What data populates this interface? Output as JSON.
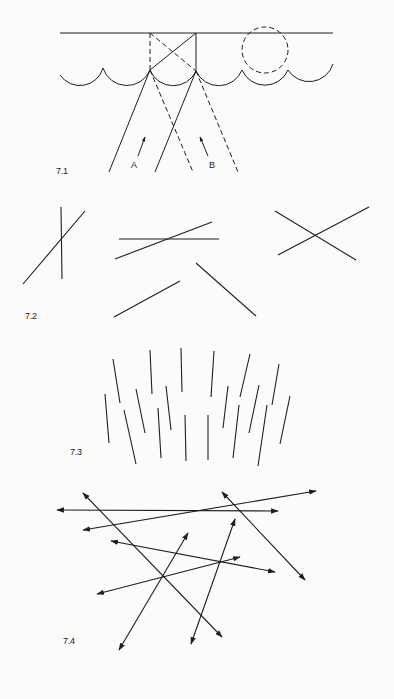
{
  "page": {
    "background": "#fbfbf9",
    "ink_color": "#1e1e1e"
  },
  "figures": [
    {
      "id": "7.1",
      "label": "7.1",
      "description": "Wave fronts with reflected rays A and B",
      "ray_labels": [
        "A",
        "B"
      ]
    },
    {
      "id": "7.2",
      "label": "7.2",
      "description": "Pairs of intersecting and non-intersecting line segments"
    },
    {
      "id": "7.3",
      "label": "7.3",
      "description": "Field of near-vertical short line segments"
    },
    {
      "id": "7.4",
      "label": "7.4",
      "description": "Set of double-headed arrows crossing at various angles"
    }
  ]
}
